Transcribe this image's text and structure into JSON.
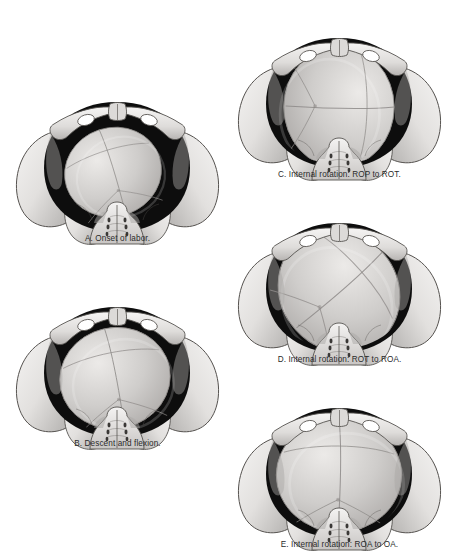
{
  "figure": {
    "style": "grayscale medical illustration",
    "background_color": "#ffffff",
    "caption_color": "#2b2b2b",
    "bone_color": "#e2e0de",
    "bone_shadow_color": "#a9a7a5",
    "bone_outline_color": "#55524f",
    "canal_color": "#0d0d0d",
    "head_color": "#cfcdcb",
    "head_outline_color": "#8d8a88",
    "suture_color": "#8d8a88",
    "view": "pelvic inlet viewed from above and in front"
  },
  "panels": [
    {
      "id": "A",
      "letter": "A",
      "caption": "A. Onset of labor.",
      "stage": "onset of labor",
      "position": "right occiput posterior (ROP)",
      "head_scale": 0.74,
      "head_rotation_deg": -18,
      "head_offset_x": -4,
      "head_offset_y": 2,
      "canal_visible": true,
      "column": "left",
      "x": 10,
      "y": 78,
      "w": 215,
      "h": 175,
      "caption_y": 156
    },
    {
      "id": "B",
      "letter": "B",
      "caption": "B. Descent and flexion.",
      "stage": "descent and flexion",
      "position": "right occiput posterior (ROP), descending",
      "head_scale": 0.84,
      "head_rotation_deg": -12,
      "head_offset_x": -2,
      "head_offset_y": 3,
      "canal_visible": true,
      "column": "left",
      "x": 10,
      "y": 283,
      "w": 215,
      "h": 175,
      "caption_y": 156
    },
    {
      "id": "C",
      "letter": "C",
      "caption": "C. Internal rotation: ROP to ROT.",
      "stage": "internal rotation",
      "position": "right occiput transverse (ROT)",
      "head_scale": 0.92,
      "head_rotation_deg": 90,
      "head_offset_x": 0,
      "head_offset_y": 1,
      "canal_visible": true,
      "column": "right",
      "x": 232,
      "y": 14,
      "w": 215,
      "h": 175,
      "caption_y": 156
    },
    {
      "id": "D",
      "letter": "D",
      "caption": "D. Internal rotation: ROT to ROA.",
      "stage": "internal rotation",
      "position": "right occiput anterior (ROA)",
      "head_scale": 0.97,
      "head_rotation_deg": 48,
      "head_offset_x": 0,
      "head_offset_y": 0,
      "canal_visible": true,
      "column": "right",
      "x": 232,
      "y": 199,
      "w": 215,
      "h": 175,
      "caption_y": 156
    },
    {
      "id": "E",
      "letter": "E",
      "caption": "E. Internal rotation: ROA to OA.",
      "stage": "internal rotation complete",
      "position": "occiput anterior (OA)",
      "head_scale": 0.95,
      "head_rotation_deg": 0,
      "head_offset_x": 0,
      "head_offset_y": -1,
      "canal_visible": true,
      "column": "right",
      "x": 232,
      "y": 384,
      "w": 215,
      "h": 175,
      "caption_y": 156
    }
  ],
  "anatomy_labels": {
    "pubic_symphysis": "pubic-symphysis",
    "iliac_wing_left": "left-iliac-wing",
    "iliac_wing_right": "right-iliac-wing",
    "obturator_foramen_left": "left-obturator-foramen",
    "obturator_foramen_right": "right-obturator-foramen",
    "sacrum": "sacrum",
    "birth_canal": "birth-canal",
    "fetal_head": "fetal-head",
    "sagittal_suture": "sagittal-suture",
    "lambdoid_suture": "lambdoid-suture",
    "coronal_suture": "coronal-suture"
  }
}
